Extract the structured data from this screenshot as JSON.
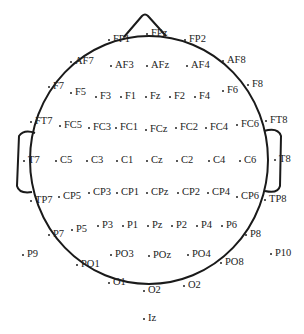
{
  "diagram": {
    "head": {
      "outline_color": "#1a1a1a",
      "label_color": "#222222"
    },
    "electrodes": [
      {
        "label": "FP1",
        "x": 108,
        "y": 39
      },
      {
        "label": "FPz",
        "x": 146,
        "y": 33
      },
      {
        "label": "FP2",
        "x": 184,
        "y": 39
      },
      {
        "label": "AF7",
        "x": 70,
        "y": 61
      },
      {
        "label": "AF3",
        "x": 110,
        "y": 65
      },
      {
        "label": "AFz",
        "x": 146,
        "y": 65
      },
      {
        "label": "AF4",
        "x": 186,
        "y": 65
      },
      {
        "label": "AF8",
        "x": 222,
        "y": 60
      },
      {
        "label": "F7",
        "x": 48,
        "y": 86
      },
      {
        "label": "F5",
        "x": 70,
        "y": 92
      },
      {
        "label": "F3",
        "x": 95,
        "y": 96
      },
      {
        "label": "F1",
        "x": 120,
        "y": 96
      },
      {
        "label": "Fz",
        "x": 145,
        "y": 96
      },
      {
        "label": "F2",
        "x": 169,
        "y": 96
      },
      {
        "label": "F4",
        "x": 194,
        "y": 96
      },
      {
        "label": "F6",
        "x": 222,
        "y": 90
      },
      {
        "label": "F8",
        "x": 247,
        "y": 84
      },
      {
        "label": "FT7",
        "x": 30,
        "y": 121
      },
      {
        "label": "FC5",
        "x": 59,
        "y": 125
      },
      {
        "label": "FC3",
        "x": 88,
        "y": 127
      },
      {
        "label": "FC1",
        "x": 115,
        "y": 127
      },
      {
        "label": "FCz",
        "x": 145,
        "y": 129
      },
      {
        "label": "FC2",
        "x": 175,
        "y": 127
      },
      {
        "label": "FC4",
        "x": 205,
        "y": 127
      },
      {
        "label": "FC6",
        "x": 236,
        "y": 124
      },
      {
        "label": "FT8",
        "x": 265,
        "y": 120
      },
      {
        "label": "T7",
        "x": 23,
        "y": 160
      },
      {
        "label": "C5",
        "x": 55,
        "y": 160
      },
      {
        "label": "C3",
        "x": 86,
        "y": 160
      },
      {
        "label": "C1",
        "x": 116,
        "y": 160
      },
      {
        "label": "Cz",
        "x": 146,
        "y": 160
      },
      {
        "label": "C2",
        "x": 176,
        "y": 160
      },
      {
        "label": "C4",
        "x": 208,
        "y": 160
      },
      {
        "label": "C6",
        "x": 239,
        "y": 160
      },
      {
        "label": "T8",
        "x": 274,
        "y": 159
      },
      {
        "label": "TP7",
        "x": 30,
        "y": 200
      },
      {
        "label": "CP5",
        "x": 58,
        "y": 196
      },
      {
        "label": "CP3",
        "x": 88,
        "y": 192
      },
      {
        "label": "CP1",
        "x": 116,
        "y": 192
      },
      {
        "label": "CPz",
        "x": 146,
        "y": 192
      },
      {
        "label": "CP2",
        "x": 177,
        "y": 192
      },
      {
        "label": "CP4",
        "x": 207,
        "y": 192
      },
      {
        "label": "CP6",
        "x": 236,
        "y": 196
      },
      {
        "label": "TP8",
        "x": 264,
        "y": 199
      },
      {
        "label": "P7",
        "x": 48,
        "y": 234
      },
      {
        "label": "P5",
        "x": 71,
        "y": 229
      },
      {
        "label": "P3",
        "x": 97,
        "y": 225
      },
      {
        "label": "P1",
        "x": 122,
        "y": 225
      },
      {
        "label": "Pz",
        "x": 147,
        "y": 225
      },
      {
        "label": "P2",
        "x": 171,
        "y": 225
      },
      {
        "label": "P4",
        "x": 196,
        "y": 225
      },
      {
        "label": "P6",
        "x": 221,
        "y": 225
      },
      {
        "label": "P8",
        "x": 245,
        "y": 234
      },
      {
        "label": "P9",
        "x": 22,
        "y": 254
      },
      {
        "label": "PO1",
        "x": 76,
        "y": 264
      },
      {
        "label": "PO3",
        "x": 110,
        "y": 254
      },
      {
        "label": "POz",
        "x": 148,
        "y": 255
      },
      {
        "label": "PO4",
        "x": 187,
        "y": 254
      },
      {
        "label": "PO8",
        "x": 220,
        "y": 262
      },
      {
        "label": "P10",
        "x": 270,
        "y": 253
      },
      {
        "label": "O1",
        "x": 108,
        "y": 282
      },
      {
        "label": "O2",
        "x": 143,
        "y": 290
      },
      {
        "label": "O2",
        "x": 183,
        "y": 285
      },
      {
        "label": "Iz",
        "x": 143,
        "y": 318
      }
    ]
  }
}
